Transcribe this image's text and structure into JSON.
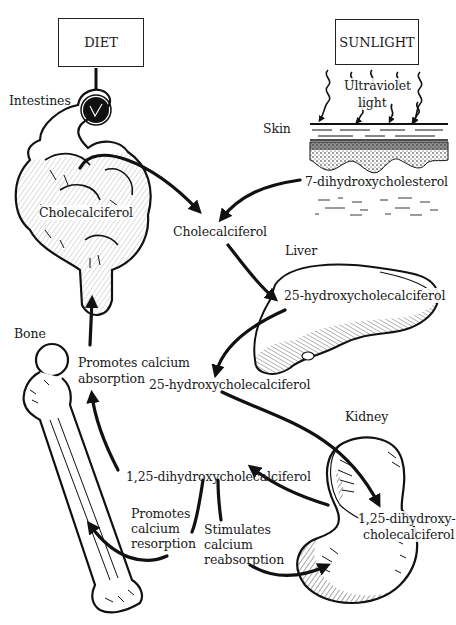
{
  "diagram": {
    "sources": {
      "diet": "DIET",
      "sunlight": "SUNLIGHT"
    },
    "organs": {
      "intestines": "Intestines",
      "skin": "Skin",
      "liver": "Liver",
      "bone": "Bone",
      "kidney": "Kidney"
    },
    "labels": {
      "uv_line1": "Ultraviolet",
      "uv_line2": "light",
      "precursor_skin": "7-dihydroxycholesterol",
      "intestine_compound": "Cholecalciferol",
      "central_cholecalciferol": "Cholecalciferol",
      "liver_compound": "25-hydroxycholecalciferol",
      "circulating_25": "25-hydroxycholecalciferol",
      "kidney_compound_line1": "1,25-dihydroxy-",
      "kidney_compound_line2": "cholecalciferol",
      "active_hormone": "1,25-dihydroxycholecalciferol",
      "absorption_line1": "Promotes calcium",
      "absorption_line2": "absorption",
      "resorption_line1": "Promotes",
      "resorption_line2": "calcium",
      "resorption_line3": "resorption",
      "reabsorption_line1": "Stimulates",
      "reabsorption_line2": "calcium",
      "reabsorption_line3": "reabsorption"
    },
    "edges": [
      {
        "from": "DIET",
        "to": "Intestines"
      },
      {
        "from": "Intestines: Cholecalciferol",
        "to": "Cholecalciferol"
      },
      {
        "from": "Skin: 7-dihydroxycholesterol",
        "to": "Cholecalciferol"
      },
      {
        "from": "Cholecalciferol",
        "to": "Liver: 25-hydroxycholecalciferol"
      },
      {
        "from": "Liver",
        "to": "25-hydroxycholecalciferol"
      },
      {
        "from": "25-hydroxycholecalciferol",
        "to": "Kidney: 1,25-dihydroxycholecalciferol"
      },
      {
        "from": "Kidney",
        "to": "1,25-dihydroxycholecalciferol"
      },
      {
        "from": "1,25-dihydroxycholecalciferol",
        "to": "Intestines",
        "label": "Promotes calcium absorption"
      },
      {
        "from": "1,25-dihydroxycholecalciferol",
        "to": "Bone",
        "label": "Promotes calcium resorption"
      },
      {
        "from": "1,25-dihydroxycholecalciferol",
        "to": "Kidney",
        "label": "Stimulates calcium reabsorption"
      }
    ]
  }
}
